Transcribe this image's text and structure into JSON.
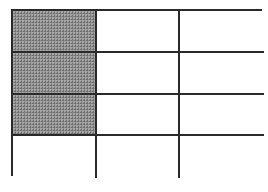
{
  "diagram": {
    "type": "fraction-grid",
    "rows": 4,
    "columns": 3,
    "total_cells": 12,
    "shaded_cells": 3,
    "shaded_positions": [
      [
        0,
        0
      ],
      [
        1,
        0
      ],
      [
        2,
        0
      ]
    ],
    "colors": {
      "border": "#2a2a2a",
      "shaded_fill": "#8e8e8e",
      "unshaded_fill": "#ffffff"
    },
    "cells": [
      [
        {
          "shaded": true
        },
        {
          "shaded": false
        },
        {
          "shaded": false
        }
      ],
      [
        {
          "shaded": true
        },
        {
          "shaded": false
        },
        {
          "shaded": false
        }
      ],
      [
        {
          "shaded": true
        },
        {
          "shaded": false
        },
        {
          "shaded": false
        }
      ],
      [
        {
          "shaded": false
        },
        {
          "shaded": false
        },
        {
          "shaded": false
        }
      ]
    ]
  }
}
